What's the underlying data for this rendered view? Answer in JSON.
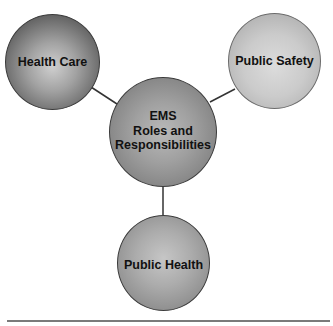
{
  "diagram": {
    "type": "hub-and-spoke",
    "center": {
      "label": "EMS\nRoles and\nResponsibilities"
    },
    "nodes": [
      {
        "label": "Health Care",
        "position": "top-left"
      },
      {
        "label": "Public Safety",
        "position": "top-right"
      },
      {
        "label": "Public Health",
        "position": "bottom"
      }
    ],
    "connections": [
      {
        "from": "EMS Roles and Responsibilities",
        "to": "Health Care"
      },
      {
        "from": "EMS Roles and Responsibilities",
        "to": "Public Safety"
      },
      {
        "from": "EMS Roles and Responsibilities",
        "to": "Public Health"
      }
    ],
    "colors": {
      "health_care": "#6a6a6a",
      "public_safety": "#c8c8c8",
      "ems_center": "#9a9a9a",
      "public_health": "#a5a5a5",
      "connector": "#333333",
      "rule": "#7a7a7a"
    }
  }
}
